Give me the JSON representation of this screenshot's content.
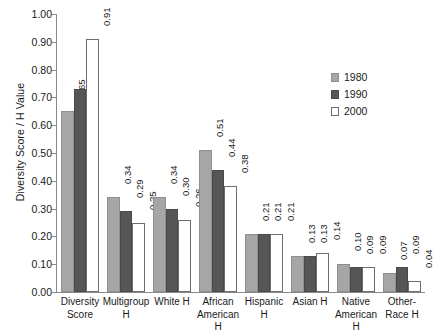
{
  "chart_data": {
    "type": "bar",
    "title": "",
    "subtitle": "",
    "xlabel": "",
    "ylabel": "Diversity Score / H Value",
    "ylim": [
      0.0,
      1.0
    ],
    "ytick_step": 0.1,
    "ytick_labels": [
      "1.00",
      "0.90",
      "0.80",
      "0.70",
      "0.60",
      "0.50",
      "0.40",
      "0.30",
      "0.20",
      "0.10",
      "0.00"
    ],
    "ytick_values": [
      1.0,
      0.9,
      0.8,
      0.7,
      0.6,
      0.5,
      0.4,
      0.3,
      0.2,
      0.1,
      0.0
    ],
    "grid": false,
    "legend_position": "right",
    "categories": [
      "Diversity Score",
      "Multigroup H",
      "White H",
      "African American H",
      "Hispanic H",
      "Asian H",
      "Native American H",
      "Other-Race H"
    ],
    "category_lines": [
      [
        "Diversity",
        "Score"
      ],
      [
        "Multigroup",
        "H"
      ],
      [
        "White H"
      ],
      [
        "African",
        "American H"
      ],
      [
        "Hispanic",
        "H"
      ],
      [
        "Asian H"
      ],
      [
        "Native",
        "American H"
      ],
      [
        "Other-",
        "Race H"
      ]
    ],
    "series": [
      {
        "name": "1980",
        "color": "#a6a6a6",
        "values": [
          0.65,
          0.34,
          0.34,
          0.51,
          0.21,
          0.13,
          0.1,
          0.07
        ],
        "labels": [
          "0.65",
          "0.34",
          "0.34",
          "0.51",
          "0.21",
          "0.13",
          "0.10",
          "0.07"
        ]
      },
      {
        "name": "1990",
        "color": "#565656",
        "values": [
          0.73,
          0.29,
          0.3,
          0.44,
          0.21,
          0.13,
          0.09,
          0.09
        ],
        "labels": [
          "0.73",
          "0.29",
          "0.30",
          "0.44",
          "0.21",
          "0.13",
          "0.09",
          "0.09"
        ]
      },
      {
        "name": "2000",
        "color": "#ffffff",
        "values": [
          0.91,
          0.25,
          0.26,
          0.38,
          0.21,
          0.14,
          0.09,
          0.04
        ],
        "labels": [
          "0.91",
          "0.25",
          "0.26",
          "0.38",
          "0.21",
          "0.14",
          "0.09",
          "0.04"
        ]
      }
    ]
  },
  "legend": {
    "items": [
      {
        "label": "1980"
      },
      {
        "label": "1990"
      },
      {
        "label": "2000"
      }
    ]
  }
}
